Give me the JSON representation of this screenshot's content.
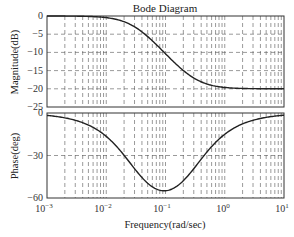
{
  "chart_data": {
    "type": "line",
    "title": "Bode Diagram",
    "xlabel": "Frequency(rad/sec)",
    "xscale": "log",
    "xlim": [
      0.001,
      10
    ],
    "x_tick_labels": [
      "10^-3",
      "10^-2",
      "10^-1",
      "10^0",
      "10^1"
    ],
    "grid": true,
    "subplots": [
      {
        "name": "magnitude",
        "ylabel": "Magnitude(dB)",
        "ylim": [
          -25,
          0
        ],
        "y_ticks": [
          0,
          -5,
          -10,
          -15,
          -20,
          -25
        ],
        "series": [
          {
            "name": "Magnitude",
            "x": [
              0.001,
              0.00316,
              0.01,
              0.0316,
              0.1,
              0.316,
              1,
              3.16,
              10
            ],
            "values": [
              0.0,
              -0.05,
              -0.4,
              -3.0,
              -10.4,
              -17.6,
              -19.6,
              -20.0,
              -20.0
            ]
          }
        ]
      },
      {
        "name": "phase",
        "ylabel": "Phase(deg)",
        "ylim": [
          -60,
          0
        ],
        "y_ticks": [
          0,
          -30,
          -60
        ],
        "series": [
          {
            "name": "Phase",
            "x": [
              0.001,
              0.00316,
              0.01,
              0.0316,
              0.1,
              0.316,
              1,
              3.16,
              10
            ],
            "values": [
              -1.7,
              -5.4,
              -16.5,
              -40.4,
              -54.9,
              -39.8,
              -15.1,
              -4.9,
              -1.5
            ]
          }
        ]
      }
    ]
  },
  "labels": {
    "title": "Bode Diagram",
    "xlabel": "Frequency(rad/sec)",
    "mag_ylabel": "Magnitude(dB)",
    "phase_ylabel": "Phase(deg)",
    "mag_ticks": [
      "0",
      "−5",
      "−10",
      "−15",
      "−20",
      "−25"
    ],
    "phase_ticks": [
      "0",
      "−30",
      "−60"
    ],
    "x_ticks": [
      "−3",
      "−2",
      "−1",
      "0",
      "1"
    ]
  },
  "model": {
    "zero_tc": 3.33,
    "pole_tc": 33.3
  }
}
